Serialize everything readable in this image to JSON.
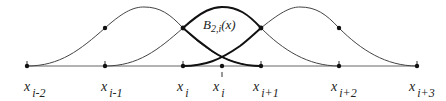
{
  "diagram": {
    "curve_label": {
      "main": "B",
      "sub": "2,i",
      "arg": "(x)"
    },
    "knots": [
      {
        "var": "x",
        "sub": "i-2",
        "x": 27
      },
      {
        "var": "x",
        "sub": "i-1",
        "x": 105
      },
      {
        "var": "x",
        "sub": "i",
        "x": 183
      },
      {
        "var": "x",
        "sub": "i",
        "sup": "1",
        "x": 222
      },
      {
        "var": "x",
        "sub": "i+1",
        "x": 261
      },
      {
        "var": "x",
        "sub": "i+2",
        "x": 339
      },
      {
        "var": "x",
        "sub": "i+3",
        "x": 417
      }
    ],
    "colors": {
      "line": "#333333",
      "bold": "#111111",
      "dot": "#111111"
    }
  }
}
